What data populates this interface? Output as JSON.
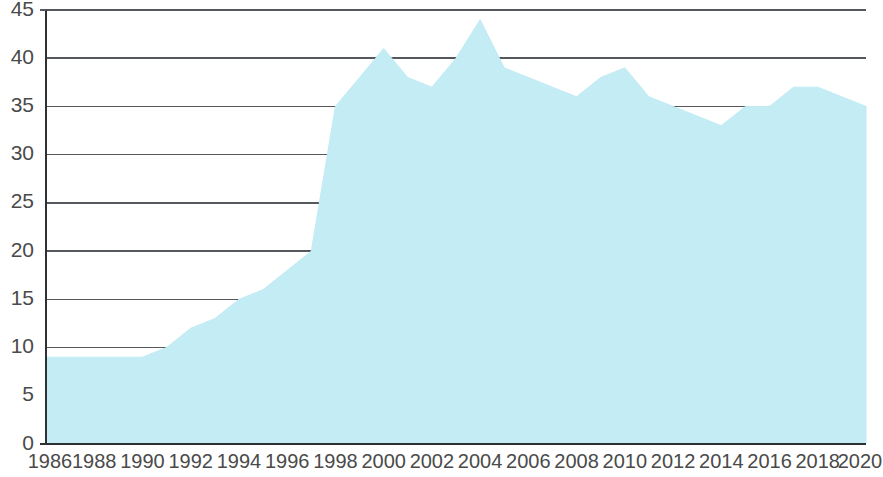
{
  "chart_data": {
    "type": "area",
    "title": "",
    "subtitle": "",
    "xlabel": "",
    "ylabel": "",
    "x": [
      1986,
      1987,
      1988,
      1989,
      1990,
      1991,
      1992,
      1993,
      1994,
      1995,
      1996,
      1997,
      1998,
      1999,
      2000,
      2001,
      2002,
      2003,
      2004,
      2005,
      2006,
      2007,
      2008,
      2009,
      2010,
      2011,
      2012,
      2013,
      2014,
      2015,
      2016,
      2017,
      2018,
      2019,
      2020
    ],
    "values": [
      9,
      9,
      9,
      9,
      9,
      10,
      12,
      13,
      15,
      16,
      18,
      20,
      35,
      38,
      41,
      38,
      37,
      40,
      44,
      39,
      38,
      37,
      36,
      38,
      39,
      36,
      35,
      34,
      33,
      35,
      35,
      37,
      37,
      36,
      35
    ],
    "series": [
      {
        "name": "",
        "values": [
          9,
          9,
          9,
          9,
          9,
          10,
          12,
          13,
          15,
          16,
          18,
          20,
          35,
          38,
          41,
          38,
          37,
          40,
          44,
          39,
          38,
          37,
          36,
          38,
          39,
          36,
          35,
          34,
          33,
          35,
          35,
          37,
          37,
          36,
          35
        ]
      }
    ],
    "xlim": [
      1986,
      2020
    ],
    "ylim": [
      0,
      45
    ],
    "ytick_labels": [
      "45",
      "40",
      "35",
      "30",
      "25",
      "20",
      "15",
      "10",
      "5",
      "0"
    ],
    "ytick_values": [
      45,
      40,
      35,
      30,
      25,
      20,
      15,
      10,
      5,
      0
    ],
    "ytick_interval": 5,
    "xtick_labels": [
      "1986",
      "1988",
      "1990",
      "1992",
      "1994",
      "1996",
      "1998",
      "2000",
      "2002",
      "2004",
      "2006",
      "2008",
      "2010",
      "2012",
      "2014",
      "2016",
      "2018",
      "2020"
    ],
    "xtick_values": [
      1986,
      1988,
      1990,
      1992,
      1994,
      1996,
      1998,
      2000,
      2002,
      2004,
      2006,
      2008,
      2010,
      2012,
      2014,
      2016,
      2018,
      2020
    ],
    "xtick_interval": 2,
    "grid": {
      "horizontal": true,
      "vertical": false,
      "gridline_values": [
        45,
        40,
        35,
        30,
        25,
        20,
        15,
        10
      ]
    },
    "legend": {
      "visible": false,
      "position": "none",
      "entries": []
    },
    "annotations": [],
    "colors": {
      "area_fill": "#c3ecf4",
      "area_edge": "#c3ecf4",
      "gridline": "#55585c",
      "axis": "#2e3033",
      "tick_label": "#4a4a4a",
      "background": "#ffffff"
    },
    "peaks": [
      {
        "x": 2000,
        "y": 41
      },
      {
        "x": 2004,
        "y": 44
      },
      {
        "x": 2010,
        "y": 39
      }
    ],
    "troughs": [
      {
        "x": 1990,
        "y": 9
      },
      {
        "x": 2002,
        "y": 37
      },
      {
        "x": 2014,
        "y": 33
      }
    ]
  }
}
